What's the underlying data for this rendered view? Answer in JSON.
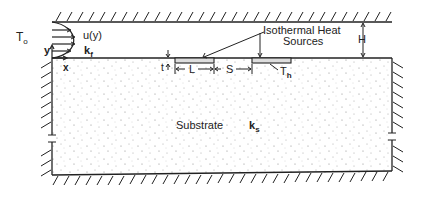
{
  "diagram": {
    "labels": {
      "inlet_temperature": "T",
      "inlet_temperature_sub": "o",
      "velocity_profile": "u(y)",
      "fluid_conductivity": "k",
      "fluid_conductivity_sub": "f",
      "y_axis": "y",
      "x_axis": "x",
      "heat_sources_line1": "Isothermal Heat",
      "heat_sources_line2": "Sources",
      "source_length": "L",
      "source_spacing": "S",
      "source_thickness": "t",
      "source_temperature": "T",
      "source_temperature_sub": "h",
      "channel_height": "H",
      "substrate": "Substrate",
      "substrate_conductivity": "k",
      "substrate_conductivity_sub": "s"
    },
    "colors": {
      "line": "#222222",
      "background": "#ffffff",
      "stipple": "#777777"
    }
  }
}
